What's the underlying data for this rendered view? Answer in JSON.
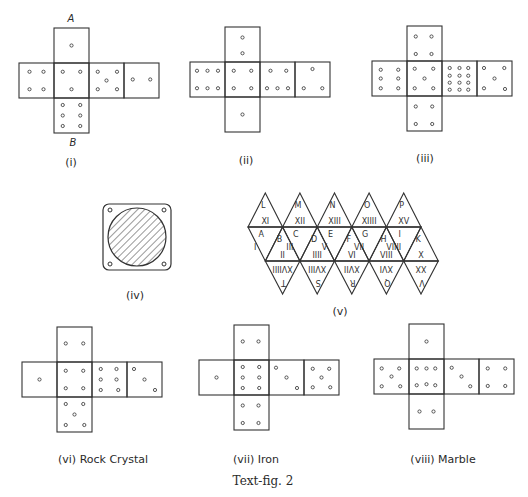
{
  "figure": {
    "caption": "Text-fig. 2",
    "nets": [
      {
        "id": "i",
        "label": "(i)",
        "top_label": "A",
        "bottom_label": "B",
        "origin": [
          19,
          28
        ],
        "faces": {
          "top": 1,
          "left": 4,
          "center": 5,
          "right": 5,
          "far_right": 2,
          "bottom": 6
        },
        "pips": {
          "top": [
            [
              0.5,
              0.5
            ]
          ],
          "left": [
            [
              0.3,
              0.25
            ],
            [
              0.7,
              0.25
            ],
            [
              0.3,
              0.75
            ],
            [
              0.7,
              0.75
            ]
          ],
          "center": [
            [
              0.25,
              0.25
            ],
            [
              0.75,
              0.25
            ],
            [
              0.5,
              0.75
            ]
          ],
          "right": [
            [
              0.25,
              0.25
            ],
            [
              0.8,
              0.25
            ],
            [
              0.5,
              0.5
            ],
            [
              0.25,
              0.75
            ],
            [
              0.8,
              0.75
            ]
          ],
          "far_right": [
            [
              0.25,
              0.47
            ],
            [
              0.75,
              0.47
            ]
          ],
          "bottom": [
            [
              0.25,
              0.2
            ],
            [
              0.75,
              0.2
            ],
            [
              0.25,
              0.5
            ],
            [
              0.75,
              0.5
            ],
            [
              0.25,
              0.8
            ],
            [
              0.75,
              0.8
            ]
          ]
        }
      },
      {
        "id": "ii",
        "label": "(ii)",
        "origin": [
          190,
          27
        ],
        "pips": {
          "top": [
            [
              0.5,
              0.3
            ],
            [
              0.5,
              0.75
            ]
          ],
          "left": [
            [
              0.2,
              0.25
            ],
            [
              0.5,
              0.25
            ],
            [
              0.8,
              0.25
            ],
            [
              0.2,
              0.75
            ],
            [
              0.5,
              0.75
            ],
            [
              0.8,
              0.75
            ]
          ],
          "center": [
            [
              0.25,
              0.25
            ],
            [
              0.75,
              0.25
            ],
            [
              0.25,
              0.75
            ],
            [
              0.75,
              0.75
            ]
          ],
          "right": [
            [
              0.3,
              0.25
            ],
            [
              0.75,
              0.25
            ],
            [
              0.2,
              0.75
            ],
            [
              0.5,
              0.75
            ],
            [
              0.8,
              0.75
            ]
          ],
          "far_right": [
            [
              0.5,
              0.2
            ],
            [
              0.25,
              0.75
            ],
            [
              0.78,
              0.75
            ]
          ],
          "bottom": [
            [
              0.5,
              0.5
            ]
          ]
        }
      },
      {
        "id": "iii",
        "label": "(iii)",
        "origin": [
          372,
          26
        ],
        "pips": {
          "top": [
            [
              0.25,
              0.3
            ],
            [
              0.7,
              0.3
            ],
            [
              0.25,
              0.8
            ],
            [
              0.7,
              0.8
            ]
          ],
          "left": [
            [
              0.25,
              0.25
            ],
            [
              0.75,
              0.25
            ],
            [
              0.25,
              0.5
            ],
            [
              0.75,
              0.5
            ],
            [
              0.25,
              0.78
            ],
            [
              0.75,
              0.78
            ]
          ],
          "center": [
            [
              0.22,
              0.22
            ],
            [
              0.75,
              0.22
            ],
            [
              0.5,
              0.5
            ],
            [
              0.22,
              0.78
            ],
            [
              0.75,
              0.78
            ]
          ],
          "right": [
            [
              0.22,
              0.2
            ],
            [
              0.5,
              0.2
            ],
            [
              0.75,
              0.2
            ],
            [
              0.22,
              0.42
            ],
            [
              0.5,
              0.42
            ],
            [
              0.75,
              0.42
            ],
            [
              0.22,
              0.62
            ],
            [
              0.5,
              0.62
            ],
            [
              0.75,
              0.62
            ],
            [
              0.22,
              0.82
            ],
            [
              0.5,
              0.82
            ],
            [
              0.75,
              0.82
            ]
          ],
          "far_right": [
            [
              0.2,
              0.2
            ],
            [
              0.78,
              0.2
            ],
            [
              0.5,
              0.5
            ],
            [
              0.2,
              0.78
            ],
            [
              0.8,
              0.8
            ]
          ],
          "bottom": [
            [
              0.25,
              0.3
            ],
            [
              0.72,
              0.3
            ],
            [
              0.25,
              0.8
            ],
            [
              0.72,
              0.8
            ]
          ]
        }
      },
      {
        "id": "vi",
        "label": "(vi) Rock Crystal",
        "origin": [
          22,
          327
        ],
        "pips": {
          "top": [
            [
              0.25,
              0.47
            ],
            [
              0.75,
              0.47
            ]
          ],
          "left": [
            [
              0.5,
              0.5
            ]
          ],
          "center": [
            [
              0.25,
              0.25
            ],
            [
              0.75,
              0.25
            ],
            [
              0.25,
              0.75
            ],
            [
              0.75,
              0.75
            ]
          ],
          "right": [
            [
              0.25,
              0.2
            ],
            [
              0.7,
              0.2
            ],
            [
              0.25,
              0.5
            ],
            [
              0.7,
              0.5
            ],
            [
              0.25,
              0.8
            ],
            [
              0.75,
              0.8
            ]
          ],
          "far_right": [
            [
              0.2,
              0.2
            ],
            [
              0.5,
              0.5
            ],
            [
              0.8,
              0.8
            ]
          ],
          "bottom": [
            [
              0.25,
              0.2
            ],
            [
              0.75,
              0.2
            ],
            [
              0.5,
              0.5
            ],
            [
              0.25,
              0.8
            ],
            [
              0.78,
              0.8
            ]
          ]
        }
      },
      {
        "id": "vii",
        "label": "(vii) Iron",
        "origin": [
          199,
          325
        ],
        "pips": {
          "top": [
            [
              0.25,
              0.47
            ],
            [
              0.7,
              0.47
            ]
          ],
          "left": [
            [
              0.5,
              0.5
            ]
          ],
          "center": [
            [
              0.25,
              0.2
            ],
            [
              0.72,
              0.2
            ],
            [
              0.25,
              0.5
            ],
            [
              0.72,
              0.5
            ],
            [
              0.25,
              0.8
            ],
            [
              0.72,
              0.8
            ]
          ],
          "right": [
            [
              0.2,
              0.22
            ],
            [
              0.5,
              0.5
            ],
            [
              0.8,
              0.8
            ]
          ],
          "far_right": [
            [
              0.25,
              0.25
            ],
            [
              0.72,
              0.25
            ],
            [
              0.5,
              0.5
            ],
            [
              0.25,
              0.78
            ],
            [
              0.75,
              0.78
            ]
          ],
          "bottom": [
            [
              0.25,
              0.3
            ],
            [
              0.7,
              0.3
            ],
            [
              0.25,
              0.8
            ],
            [
              0.7,
              0.8
            ]
          ]
        }
      },
      {
        "id": "viii",
        "label": "(viii) Marble",
        "origin": [
          374,
          324
        ],
        "pips": {
          "top": [
            [
              0.5,
              0.5
            ]
          ],
          "left": [
            [
              0.22,
              0.27
            ],
            [
              0.72,
              0.27
            ],
            [
              0.5,
              0.5
            ],
            [
              0.22,
              0.78
            ],
            [
              0.75,
              0.78
            ]
          ],
          "center": [
            [
              0.22,
              0.27
            ],
            [
              0.5,
              0.27
            ],
            [
              0.75,
              0.27
            ],
            [
              0.22,
              0.75
            ],
            [
              0.5,
              0.72
            ],
            [
              0.75,
              0.75
            ]
          ],
          "right": [
            [
              0.22,
              0.25
            ],
            [
              0.5,
              0.5
            ],
            [
              0.75,
              0.78
            ]
          ],
          "far_right": [
            [
              0.25,
              0.27
            ],
            [
              0.75,
              0.27
            ],
            [
              0.25,
              0.77
            ],
            [
              0.75,
              0.77
            ]
          ],
          "bottom": [
            [
              0.3,
              0.5
            ],
            [
              0.7,
              0.5
            ]
          ]
        }
      }
    ],
    "label_iv": "(iv)",
    "label_v": "(v)",
    "icosahedron": {
      "top_letters": [
        "L",
        "M",
        "N",
        "O",
        "P"
      ],
      "top_numerals": [
        "XI",
        "XII",
        "XIII",
        "XIIII",
        "XV"
      ],
      "middle_up_letters": [
        "A",
        "C",
        "E",
        "G",
        "I"
      ],
      "middle_down_letters": [
        "B",
        "D",
        "F",
        "H",
        "K"
      ],
      "middle_left_numerals": [
        "I",
        "III",
        "V",
        "VII",
        "VIIII"
      ],
      "middle_bottom_numerals": [
        "II",
        "IIII",
        "VI",
        "VIII",
        "X"
      ],
      "bottom_numerals": [
        "XVIIII",
        "XVIII",
        "XVII",
        "XVI",
        "XX"
      ],
      "bottom_letters": [
        "T",
        "S",
        "R",
        "Q",
        "V"
      ]
    }
  }
}
